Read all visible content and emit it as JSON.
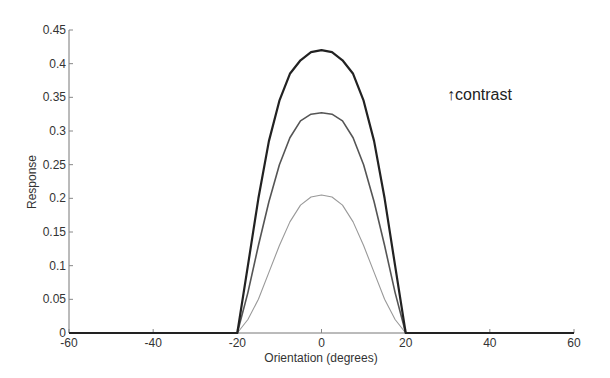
{
  "chart_data": {
    "type": "line",
    "title": "",
    "xlabel": "Orientation (degrees)",
    "ylabel": "Response",
    "xlim": [
      -60,
      60
    ],
    "ylim": [
      0,
      0.45
    ],
    "grid": false,
    "x_ticks": [
      -60,
      -40,
      -20,
      0,
      20,
      40,
      60
    ],
    "x_tick_labels": [
      "-60",
      "-40",
      "-20",
      "0",
      "20",
      "40",
      "60"
    ],
    "y_ticks": [
      0,
      0.05,
      0.1,
      0.15,
      0.2,
      0.25,
      0.3,
      0.35,
      0.4,
      0.45
    ],
    "y_tick_labels": [
      "0",
      "0.05",
      "0.1",
      "0.15",
      "0.2",
      "0.25",
      "0.3",
      "0.35",
      "0.4",
      "0.45"
    ],
    "annotation": "↑contrast",
    "x": [
      -60,
      -20,
      -17.5,
      -15,
      -12.5,
      -10,
      -7.5,
      -5,
      -2.5,
      0,
      2.5,
      5,
      7.5,
      10,
      12.5,
      15,
      17.5,
      20,
      60
    ],
    "series": [
      {
        "name": "high contrast",
        "color": "#222222",
        "width": 2.2,
        "values": [
          0,
          0,
          0.1,
          0.2,
          0.285,
          0.345,
          0.385,
          0.405,
          0.417,
          0.42,
          0.417,
          0.405,
          0.385,
          0.345,
          0.285,
          0.2,
          0.1,
          0,
          0
        ]
      },
      {
        "name": "medium contrast",
        "color": "#555555",
        "width": 1.6,
        "values": [
          0,
          0,
          0.06,
          0.13,
          0.195,
          0.25,
          0.29,
          0.315,
          0.325,
          0.327,
          0.325,
          0.315,
          0.29,
          0.25,
          0.195,
          0.13,
          0.06,
          0,
          0
        ]
      },
      {
        "name": "low contrast",
        "color": "#999999",
        "width": 1.1,
        "values": [
          0,
          0,
          0.02,
          0.05,
          0.09,
          0.13,
          0.165,
          0.19,
          0.202,
          0.205,
          0.202,
          0.19,
          0.165,
          0.13,
          0.09,
          0.05,
          0.02,
          0,
          0
        ]
      }
    ]
  }
}
